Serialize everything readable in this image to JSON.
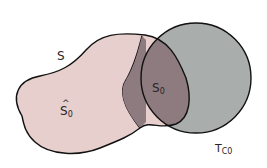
{
  "diagram": {
    "type": "set-overlap",
    "colors": {
      "background": "#ffffff",
      "set_S_fill": "#e7cfcd",
      "circle_fill": "#a9adab",
      "intersection_fill": "#8e7b7f",
      "outline": "#111111"
    },
    "labels": {
      "S": {
        "main": "S",
        "sub": ""
      },
      "S_hat_0": {
        "hat": "^",
        "main": "S",
        "sub": "0"
      },
      "S_0": {
        "main": "S",
        "sub": "0"
      },
      "T_c0": {
        "main": "T",
        "sub": "C0"
      }
    }
  }
}
